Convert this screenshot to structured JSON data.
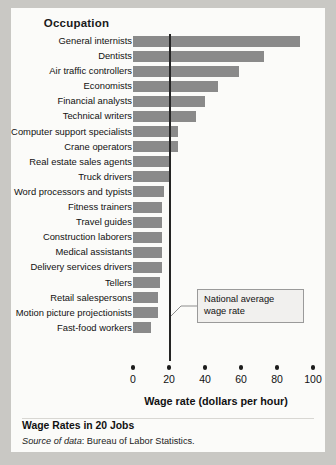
{
  "card": {
    "column_header": "Occupation",
    "caption_title": "Wage Rates in 20 Jobs",
    "source_prefix": "Source of data",
    "source_text": ": Bureau of Labor Statistics."
  },
  "callout": {
    "line1": "National average",
    "line2": "wage rate"
  },
  "colors": {
    "bar": "#8a8a8a",
    "average_line": "#242424",
    "card_background": "#fbfbf9",
    "page_background": "#c9c8c4",
    "callout_background": "#f1f0ee",
    "callout_border": "#9a9a9a"
  },
  "chart_data": {
    "type": "bar",
    "orientation": "horizontal",
    "title": "Wage Rates in 20 Jobs",
    "xlabel": "Wage rate (dollars per hour)",
    "ylabel": "Occupation",
    "xlim": [
      0,
      100
    ],
    "xticks": [
      0,
      20,
      40,
      60,
      80,
      100
    ],
    "xtick_labels": [
      "0",
      "20",
      "40",
      "60",
      "80",
      "100"
    ],
    "grid": false,
    "legend": null,
    "annotations": [
      {
        "text": "National average wage rate",
        "type": "vertical-reference-line",
        "value": 20
      }
    ],
    "categories": [
      "General internists",
      "Dentists",
      "Air traffic controllers",
      "Economists",
      "Financial analysts",
      "Technical writers",
      "Computer support specialists",
      "Crane operators",
      "Real estate sales agents",
      "Truck drivers",
      "Word processors and typists",
      "Fitness trainers",
      "Travel guides",
      "Construction laborers",
      "Medical assistants",
      "Delivery services drivers",
      "Tellers",
      "Retail salespersons",
      "Motion picture projectionists",
      "Fast-food workers"
    ],
    "values": [
      93,
      73,
      59,
      47,
      40,
      35,
      25,
      25,
      20,
      20,
      17,
      16,
      16,
      16,
      16,
      16,
      15,
      14,
      14,
      10
    ]
  }
}
